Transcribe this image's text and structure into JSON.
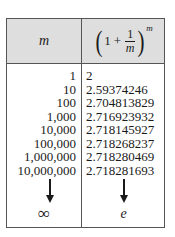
{
  "table": {
    "header": {
      "col1": "m",
      "col2": {
        "open_paren": "(",
        "one": "1",
        "plus": "+",
        "frac_num": "1",
        "frac_den": "m",
        "close_paren": ")",
        "exponent": "m"
      }
    },
    "rows": [
      {
        "m": "1",
        "value": "2"
      },
      {
        "m": "10",
        "value": "2.59374246"
      },
      {
        "m": "100",
        "value": "2.704813829"
      },
      {
        "m": "1,000",
        "value": "2.716923932"
      },
      {
        "m": "10,000",
        "value": "2.718145927"
      },
      {
        "m": "100,000",
        "value": "2.718268237"
      },
      {
        "m": "1,000,000",
        "value": "2.718280469"
      },
      {
        "m": "10,000,000",
        "value": "2.718281693"
      }
    ],
    "limit": {
      "m": "∞",
      "value": "e"
    },
    "colors": {
      "header_bg": "#dedede",
      "border": "#555555",
      "text": "#1a1a1a"
    }
  }
}
